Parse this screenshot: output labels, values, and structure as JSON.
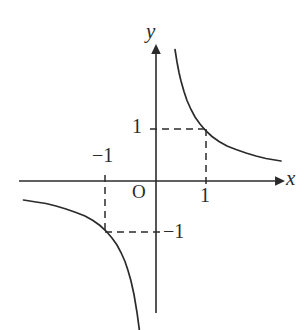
{
  "figure": {
    "background_color": "#ffffff",
    "stroke_color": "#2b2b2b",
    "text_color": "#2b2b2b"
  },
  "labels": {
    "x_axis": "x",
    "y_axis": "y",
    "origin": "O",
    "x_tick_positive": "1",
    "x_tick_negative": "−1",
    "y_tick_positive": "1",
    "y_tick_negative": "−1"
  },
  "chart_data": {
    "type": "line",
    "title": "",
    "subtitle": "",
    "xlabel": "x",
    "ylabel": "y",
    "xlim": [
      -2.75,
      2.5
    ],
    "ylim": [
      -2.65,
      2.65
    ],
    "grid": false,
    "legend": null,
    "function": "y = 1/x",
    "axis_tick_labels": {
      "x": [
        "-1",
        "1"
      ],
      "y": [
        "-1",
        "1"
      ]
    },
    "annotations": [
      {
        "type": "dashed-guide",
        "from": [
          0,
          1
        ],
        "to": [
          1,
          1
        ],
        "orientation": "horizontal"
      },
      {
        "type": "dashed-guide",
        "from": [
          1,
          1
        ],
        "to": [
          1,
          0
        ],
        "orientation": "vertical"
      },
      {
        "type": "dashed-guide",
        "from": [
          0,
          -1
        ],
        "to": [
          -1,
          -1
        ],
        "orientation": "horizontal"
      },
      {
        "type": "dashed-guide",
        "from": [
          -1,
          -1
        ],
        "to": [
          -1,
          0
        ],
        "orientation": "vertical"
      }
    ],
    "marked_points": [
      {
        "x": 1,
        "y": 1
      },
      {
        "x": -1,
        "y": -1
      }
    ],
    "series": [
      {
        "name": "branch-quadrant-1",
        "x": [
          0.38,
          0.42,
          0.46,
          0.5,
          0.56,
          0.62,
          0.7,
          0.78,
          0.88,
          1.0,
          1.12,
          1.26,
          1.42,
          1.6,
          1.8,
          2.0,
          2.2,
          2.5
        ],
        "y": [
          2.63,
          2.38,
          2.17,
          2.0,
          1.79,
          1.61,
          1.43,
          1.28,
          1.14,
          1.0,
          0.89,
          0.79,
          0.7,
          0.63,
          0.56,
          0.5,
          0.45,
          0.4
        ]
      },
      {
        "name": "branch-quadrant-3",
        "x": [
          -2.65,
          -2.4,
          -2.2,
          -2.0,
          -1.8,
          -1.6,
          -1.42,
          -1.26,
          -1.12,
          -1.0,
          -0.88,
          -0.78,
          -0.7,
          -0.62,
          -0.56,
          -0.5,
          -0.44,
          -0.38,
          -0.33
        ],
        "y": [
          -0.38,
          -0.42,
          -0.45,
          -0.5,
          -0.56,
          -0.63,
          -0.7,
          -0.79,
          -0.89,
          -1.0,
          -1.14,
          -1.28,
          -1.43,
          -1.61,
          -1.79,
          -2.0,
          -2.27,
          -2.63,
          -3.0
        ]
      }
    ]
  }
}
